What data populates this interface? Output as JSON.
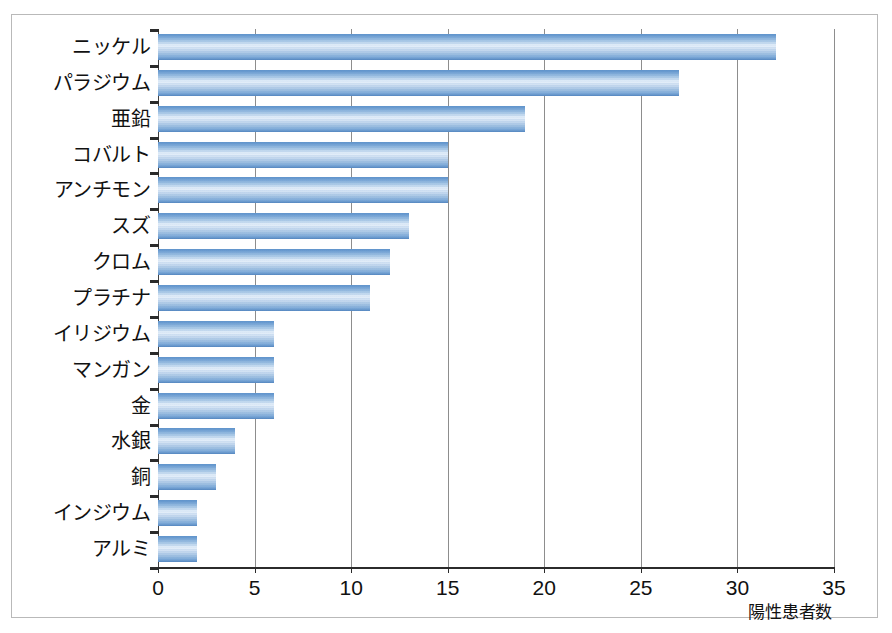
{
  "chart_data": {
    "type": "bar",
    "orientation": "horizontal",
    "title": "",
    "subtitle": "",
    "xlabel": "陽性患者数",
    "ylabel": "",
    "xlim": [
      0,
      35
    ],
    "xticks": [
      0,
      5,
      10,
      15,
      20,
      25,
      30,
      35
    ],
    "xtick_labels": [
      "0",
      "5",
      "10",
      "15",
      "20",
      "25",
      "30",
      "35"
    ],
    "grid": "vertical",
    "legend": "none",
    "bar_color": "#7ba8d7",
    "categories": [
      "ニッケル",
      "パラジウム",
      "亜鉛",
      "コバルト",
      "アンチモン",
      "スズ",
      "クロム",
      "プラチナ",
      "イリジウム",
      "マンガン",
      "金",
      "水銀",
      "銅",
      "インジウム",
      "アルミ"
    ],
    "values": [
      32,
      27,
      19,
      15,
      15,
      13,
      12,
      11,
      6,
      6,
      6,
      4,
      3,
      2,
      2
    ],
    "series": [
      {
        "name": "陽性患者数",
        "values": [
          32,
          27,
          19,
          15,
          15,
          13,
          12,
          11,
          6,
          6,
          6,
          4,
          3,
          2,
          2
        ]
      }
    ]
  },
  "colors": {
    "bar_edge": "#5486bf",
    "bar_mid": "#e9f2fb",
    "gridline": "#8d8d8d",
    "axis": "#2b2b2b",
    "frame": "#b9b9b9"
  }
}
